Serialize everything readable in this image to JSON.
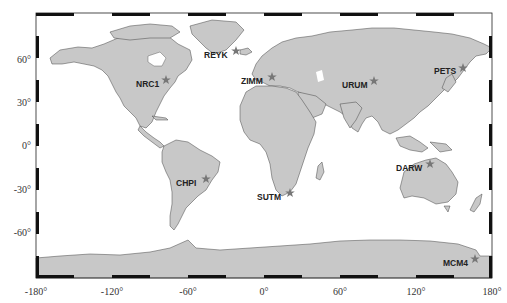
{
  "map": {
    "projection": "equirectangular",
    "lon_range": [
      -180,
      180
    ],
    "lat_range": [
      -90,
      90
    ],
    "land_color": "#c8c8c8",
    "ocean_color": "#ffffff",
    "marker_color": "#777777",
    "marker_shape": "star",
    "frame_style": "alternating black/white bars every 30°"
  },
  "axes": {
    "x_ticks": [
      {
        "value": -180,
        "label": "-180°"
      },
      {
        "value": -120,
        "label": "-120°"
      },
      {
        "value": -60,
        "label": "-60°"
      },
      {
        "value": 0,
        "label": "0°"
      },
      {
        "value": 60,
        "label": "60°"
      },
      {
        "value": 120,
        "label": "120°"
      },
      {
        "value": 180,
        "label": "180°"
      }
    ],
    "y_ticks": [
      {
        "value": 60,
        "label": "60°"
      },
      {
        "value": 30,
        "label": "30°"
      },
      {
        "value": 0,
        "label": "0°"
      },
      {
        "value": -30,
        "label": "-30°"
      },
      {
        "value": -60,
        "label": "-60°"
      }
    ]
  },
  "stations": [
    {
      "name": "REYK",
      "lon": -22,
      "lat": 64
    },
    {
      "name": "NRC1",
      "lon": -76,
      "lat": 45
    },
    {
      "name": "ZIMM",
      "lon": 7,
      "lat": 47
    },
    {
      "name": "URUM",
      "lon": 88,
      "lat": 44
    },
    {
      "name": "PETS",
      "lon": 158,
      "lat": 53
    },
    {
      "name": "CHPI",
      "lon": -45,
      "lat": -23
    },
    {
      "name": "SUTM",
      "lon": 21,
      "lat": -32
    },
    {
      "name": "DARW",
      "lon": 131,
      "lat": -12
    },
    {
      "name": "MCM4",
      "lon": 167,
      "lat": -78
    }
  ]
}
